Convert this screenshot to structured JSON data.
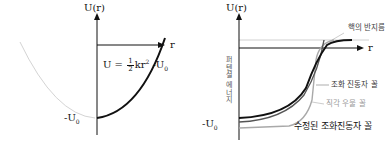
{
  "left_diagram": {
    "y_axis_label": "U(r)",
    "x_axis_label": "r",
    "min_label": "-U",
    "min_label_sub": "0",
    "equation": {
      "prefix": "U = ",
      "frac_num": "1",
      "frac_den": "2",
      "middle": "kr",
      "power": "2",
      "suffix": " -U",
      "suffix_sub": "0"
    },
    "curves": [
      {
        "name": "harmonic-oscillator-potential",
        "color": "#111111",
        "style": "solid"
      },
      {
        "name": "mirrored-harmonic-branch",
        "color": "#cccccc",
        "style": "faint"
      }
    ]
  },
  "right_diagram": {
    "y_axis_label": "U(r)",
    "x_axis_label": "r",
    "min_label": "-U",
    "min_label_sub": "0",
    "vertical_axis_title": "퍼텐셜 에너지",
    "nuclear_radius_label": "핵의 반지름",
    "legend": {
      "harmonic_oscillator": "조화 진동자 꼴",
      "square_well": "직각 우물 꼴",
      "modified_harmonic": "수정된 조화진동자 꼴"
    },
    "colors": {
      "harmonic_oscillator": "#555555",
      "square_well": "#a9a9a9",
      "modified_harmonic": "#111111",
      "zero_line": "#cccccc"
    }
  }
}
